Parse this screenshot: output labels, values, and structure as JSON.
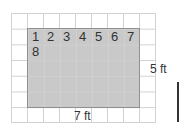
{
  "diagram": {
    "type": "area-grid",
    "grid": {
      "columns": 9,
      "rows": 7
    },
    "rectangle": {
      "width_units": 7,
      "height_units": 5,
      "fill": "#c9c9c9"
    },
    "counting_numbers": [
      "1",
      "2",
      "3",
      "4",
      "5",
      "6",
      "7",
      "8"
    ],
    "width_label": "7 ft",
    "height_label": "5 ft"
  }
}
